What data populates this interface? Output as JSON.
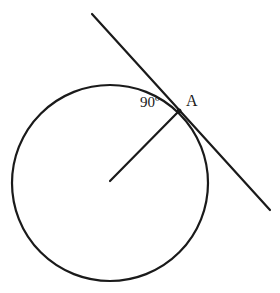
{
  "diagram": {
    "canvas": {
      "width": 280,
      "height": 293,
      "background": "#ffffff"
    },
    "stroke_color": "#1a1a1a",
    "circle": {
      "cx": 110,
      "cy": 183,
      "r": 98
    },
    "tangent_line": {
      "x1": 92,
      "y1": 14,
      "x2": 270,
      "y2": 210
    },
    "radius": {
      "x1": 110,
      "y1": 181,
      "x2": 179,
      "y2": 111
    },
    "point_a": {
      "x": 179,
      "y": 111,
      "label": "A"
    },
    "angle_label": "90º"
  }
}
